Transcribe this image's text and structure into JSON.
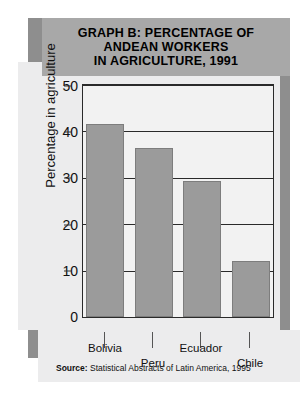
{
  "chart_data": {
    "type": "bar",
    "title": "GRAPH B: PERCENTAGE OF ANDEAN WORKERS IN AGRICULTURE, 1991",
    "title_lines": [
      "GRAPH B: PERCENTAGE OF",
      "ANDEAN WORKERS",
      "IN AGRICULTURE, 1991"
    ],
    "categories": [
      "Bolivia",
      "Peru",
      "Ecuador",
      "Chile"
    ],
    "values": [
      41.5,
      36.5,
      29.3,
      12.0
    ],
    "xlabel": "",
    "ylabel": "Percentage in agriculture",
    "ylim": [
      0,
      50
    ],
    "yticks": [
      50,
      40,
      30,
      20,
      10,
      0
    ],
    "grid": true,
    "legend": "none",
    "bar_color": "#9b9b9b",
    "source": {
      "label": "Source:",
      "text": "Statistical Abstracts of Latin America, 1995"
    }
  },
  "colors": {
    "banner": "#a8a8a8",
    "backing": "#8e8e8e",
    "panel": "#ececed",
    "plot_bg": "#f2f2f2",
    "frame": "#2a2a2a"
  }
}
